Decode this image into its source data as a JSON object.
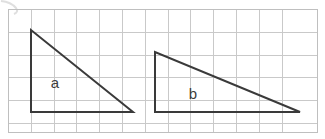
{
  "figure": {
    "kind": "geometry-grid-diagram",
    "width": 325,
    "height": 139,
    "background_color": "#ffffff",
    "grid": {
      "line_color": "#c9c9c9",
      "cell_size": 22.8,
      "columns": 13,
      "rows": 5,
      "frame_color": "#bfbfbf",
      "frame": {
        "x": 8,
        "y": 9,
        "width": 310,
        "height": 124
      }
    },
    "stroke_color": "#3a3a3a",
    "stroke_width": 2,
    "label_color": "#3d3d3d",
    "artifact": {
      "name": "scan-smudge",
      "description": "faint curved gray mark at top-left corner"
    },
    "shapes": [
      {
        "id": "triangle-a",
        "label": "a",
        "type": "right-triangle",
        "points": "31,30 31,112 133,112",
        "label_x": 55,
        "label_y": 84,
        "legs": {
          "vertical": 82,
          "horizontal": 102
        }
      },
      {
        "id": "triangle-b",
        "label": "b",
        "type": "right-triangle",
        "points": "155,52 155,112 300,112",
        "label_x": 193,
        "label_y": 95,
        "legs": {
          "vertical": 60,
          "horizontal": 145
        }
      }
    ]
  }
}
